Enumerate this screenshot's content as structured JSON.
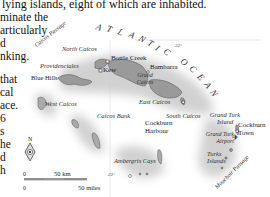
{
  "body_text": {
    "lines": [
      "lying islands, eight of which are inhabited.",
      "minate the",
      "articularly",
      "d",
      "nking.",
      "",
      "that",
      "cal",
      "ace.",
      "6",
      "s",
      "he",
      "d",
      "h"
    ]
  },
  "map": {
    "ocean_label": "ATLANTIC OCEAN",
    "ocean_letters": [
      "A",
      "T",
      "L",
      "A",
      "N",
      "T",
      "I",
      "C",
      "O",
      "C",
      "E",
      "A",
      "N"
    ],
    "latitude_labels": [
      "22°",
      "22°"
    ],
    "places": {
      "caicos_passage": "Caicos Passage",
      "north_caicos": "North Caicos",
      "bottle_creek": "Bottle Creek",
      "providenciales": "Providenciales",
      "kew": "Kew",
      "bambarra": "Bambarra",
      "blue_hills": "Blue Hills",
      "grand_caicos": "Grand Caicos",
      "west_caicos": "West Caicos",
      "east_caicos": "East Caicos",
      "caicos_bank": "Caicos Bank",
      "south_caicos": "South Caicos",
      "cockburn_harbour": "Cockburn Harbour",
      "grand_turk_island": "Grand Turk Island",
      "cockburn_town": "Cockburn Town",
      "grand_turk_airport": "Grand Turk Airport",
      "turks_islands": "Turks Islands",
      "mouchoir_passage": "Mouchoir Passage",
      "ambergris_cays": "Ambergris Cays"
    },
    "compass": {
      "label": "N"
    },
    "scale": {
      "km_zero": "0",
      "km_label": "50 km",
      "mi_zero": "0",
      "mi_label": "50 miles"
    }
  }
}
